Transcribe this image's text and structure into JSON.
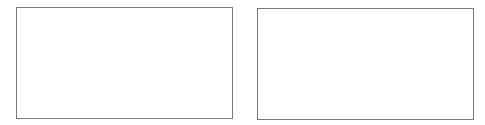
{
  "colors": {
    "background": "#ffffff",
    "panel_border": "#7a7a7a",
    "panel_fill": "#ffffff"
  },
  "panels": [
    {
      "id": "left",
      "label": ""
    },
    {
      "id": "right",
      "label": ""
    }
  ]
}
